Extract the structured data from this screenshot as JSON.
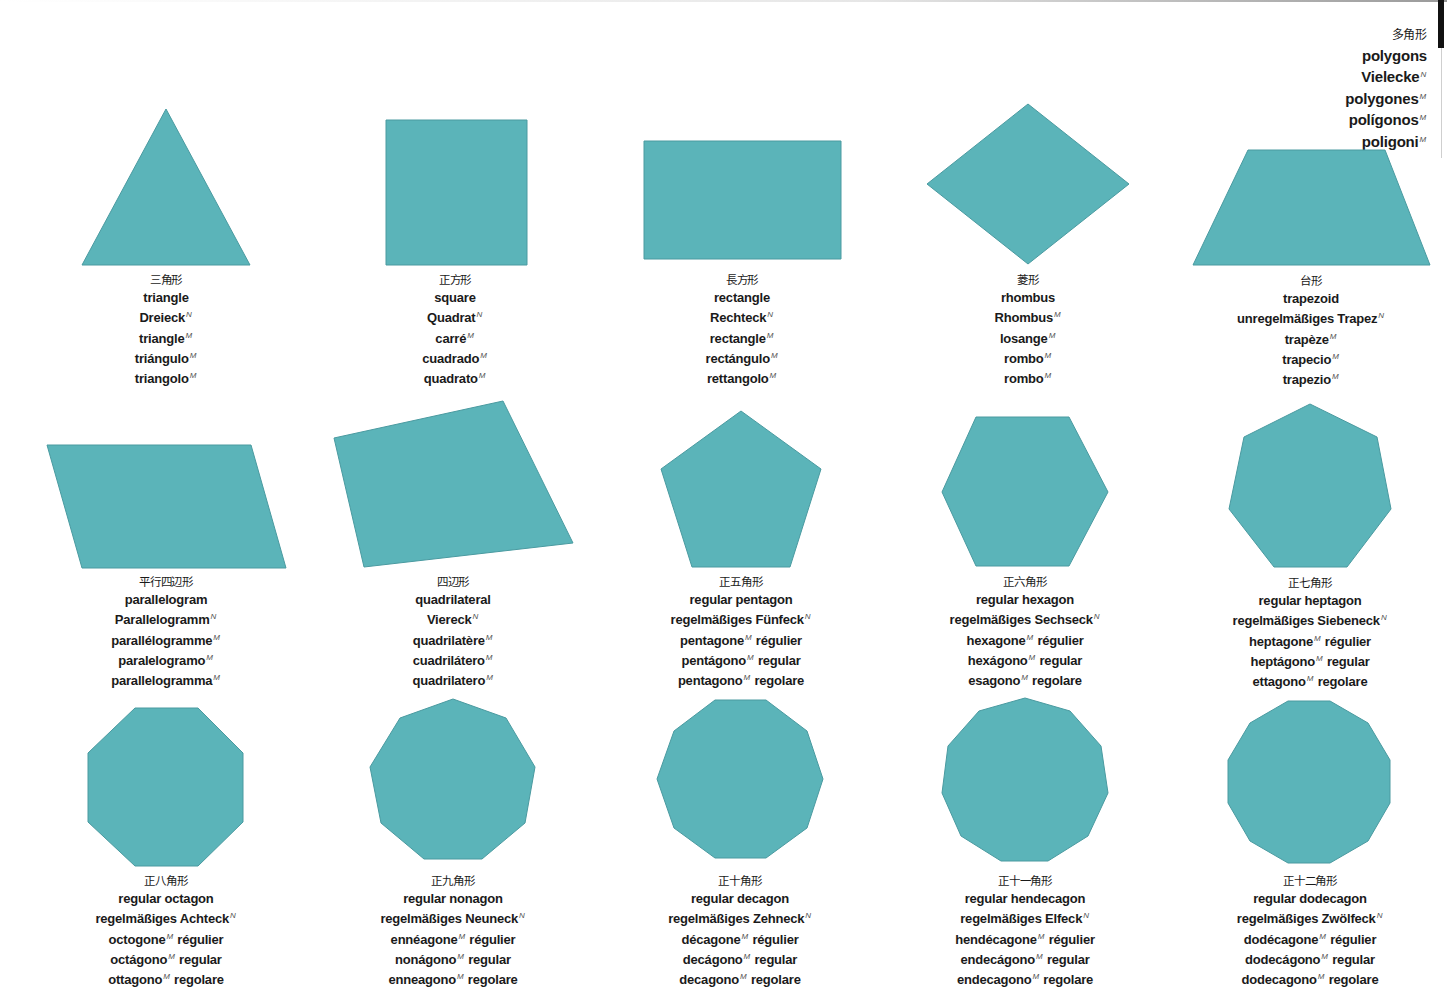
{
  "colors": {
    "shape_fill": "#5bb4b9",
    "shape_stroke": "#4a9aa0",
    "text": "#1a1a1a",
    "superscript": "#555555"
  },
  "header": {
    "lines": [
      {
        "text": "多角形",
        "sup": ""
      },
      {
        "text": "polygons",
        "sup": ""
      },
      {
        "text": "Vielecke",
        "sup": "N"
      },
      {
        "text": "polygones",
        "sup": "M"
      },
      {
        "text": "polígonos",
        "sup": "M"
      },
      {
        "text": "poligoni",
        "sup": "M"
      }
    ]
  },
  "shapes": [
    {
      "id": "triangle",
      "points": "166,109 250,265 82,265",
      "caption_x": 166,
      "caption_y": 272,
      "lines": [
        {
          "text": "三角形",
          "sup": ""
        },
        {
          "text": "triangle",
          "sup": ""
        },
        {
          "text": "Dreieck",
          "sup": "N"
        },
        {
          "text": "triangle",
          "sup": "M"
        },
        {
          "text": "triángulo",
          "sup": "M"
        },
        {
          "text": "triangolo",
          "sup": "M"
        }
      ]
    },
    {
      "id": "square",
      "points": "386,120 527,120 527,265 386,265",
      "caption_x": 455,
      "caption_y": 272,
      "lines": [
        {
          "text": "正方形",
          "sup": ""
        },
        {
          "text": "square",
          "sup": ""
        },
        {
          "text": "Quadrat",
          "sup": "N"
        },
        {
          "text": "carré",
          "sup": "M"
        },
        {
          "text": "cuadrado",
          "sup": "M"
        },
        {
          "text": "quadrato",
          "sup": "M"
        }
      ]
    },
    {
      "id": "rectangle",
      "points": "644,141 841,141 841,259 644,259",
      "caption_x": 742,
      "caption_y": 272,
      "lines": [
        {
          "text": "長方形",
          "sup": ""
        },
        {
          "text": "rectangle",
          "sup": ""
        },
        {
          "text": "Rechteck",
          "sup": "N"
        },
        {
          "text": "rectangle",
          "sup": "M"
        },
        {
          "text": "rectángulo",
          "sup": "M"
        },
        {
          "text": "rettangolo",
          "sup": "M"
        }
      ]
    },
    {
      "id": "rhombus",
      "points": "1028,104 1129,184 1028,264 927,184",
      "caption_x": 1028,
      "caption_y": 272,
      "lines": [
        {
          "text": "菱形",
          "sup": ""
        },
        {
          "text": "rhombus",
          "sup": ""
        },
        {
          "text": "Rhombus",
          "sup": "M"
        },
        {
          "text": "losange",
          "sup": "M"
        },
        {
          "text": "rombo",
          "sup": "M"
        },
        {
          "text": "rombo",
          "sup": "M"
        }
      ]
    },
    {
      "id": "trapezoid",
      "points": "1248,150 1385,150 1430,265 1193,265",
      "caption_x": 1311,
      "caption_y": 273,
      "lines": [
        {
          "text": "台形",
          "sup": ""
        },
        {
          "text": "trapezoid",
          "sup": ""
        },
        {
          "text": "unregelmäßiges Trapez",
          "sup": "N"
        },
        {
          "text": "trapèze",
          "sup": "M"
        },
        {
          "text": "trapecio",
          "sup": "M"
        },
        {
          "text": "trapezio",
          "sup": "M"
        }
      ]
    },
    {
      "id": "parallelogram",
      "points": "47,445 251,445 286,568 82,568",
      "caption_x": 166,
      "caption_y": 574,
      "lines": [
        {
          "text": "平行四辺形",
          "sup": ""
        },
        {
          "text": "parallelogram",
          "sup": ""
        },
        {
          "text": "Parallelogramm",
          "sup": "N"
        },
        {
          "text": "parallélogramme",
          "sup": "M"
        },
        {
          "text": "paralelogramo",
          "sup": "M"
        },
        {
          "text": "parallelogramma",
          "sup": "M"
        }
      ]
    },
    {
      "id": "quadrilateral",
      "points": "334,438 503,401 573,543 364,567",
      "caption_x": 453,
      "caption_y": 574,
      "lines": [
        {
          "text": "四辺形",
          "sup": ""
        },
        {
          "text": "quadrilateral",
          "sup": ""
        },
        {
          "text": "Viereck",
          "sup": "N"
        },
        {
          "text": "quadrilatère",
          "sup": "M"
        },
        {
          "text": "cuadrilátero",
          "sup": "M"
        },
        {
          "text": "quadrilatero",
          "sup": "M"
        }
      ]
    },
    {
      "id": "regular-pentagon",
      "points": "741,411 821,469 790,567 692,567 661,469",
      "caption_x": 741,
      "caption_y": 574,
      "lines": [
        {
          "text": "正五角形",
          "sup": ""
        },
        {
          "text": "regular pentagon",
          "sup": ""
        },
        {
          "text": "regelmäßiges Fünfeck",
          "sup": "N"
        },
        {
          "text": "pentagone",
          "sup": "M",
          "suffix": " régulier"
        },
        {
          "text": "pentágono",
          "sup": "M",
          "suffix": " regular"
        },
        {
          "text": "pentagono",
          "sup": "M",
          "suffix": " regolare"
        }
      ]
    },
    {
      "id": "regular-hexagon",
      "points": "976,417 1069,417 1108,492 1069,566 976,566 942,492",
      "caption_x": 1025,
      "caption_y": 574,
      "lines": [
        {
          "text": "正六角形",
          "sup": ""
        },
        {
          "text": "regular hexagon",
          "sup": ""
        },
        {
          "text": "regelmäßiges Sechseck",
          "sup": "N"
        },
        {
          "text": "hexagone",
          "sup": "M",
          "suffix": " régulier"
        },
        {
          "text": "hexágono",
          "sup": "M",
          "suffix": " regular"
        },
        {
          "text": "esagono",
          "sup": "M",
          "suffix": " regolare"
        }
      ]
    },
    {
      "id": "regular-heptagon",
      "points": "1310,404 1377,437 1391,509 1347,567 1274,567 1229,509 1244,437",
      "caption_x": 1310,
      "caption_y": 575,
      "lines": [
        {
          "text": "正七角形",
          "sup": ""
        },
        {
          "text": "regular heptagon",
          "sup": ""
        },
        {
          "text": "regelmäßiges Siebeneck",
          "sup": "N"
        },
        {
          "text": "heptagone",
          "sup": "M",
          "suffix": " régulier"
        },
        {
          "text": "heptágono",
          "sup": "M",
          "suffix": " regular"
        },
        {
          "text": "ettagono",
          "sup": "M",
          "suffix": " regolare"
        }
      ]
    },
    {
      "id": "regular-octagon",
      "points": "135,708 198,708 243,753 243,822 198,866 135,866 88,822 88,753",
      "caption_x": 166,
      "caption_y": 873,
      "lines": [
        {
          "text": "正八角形",
          "sup": ""
        },
        {
          "text": "regular octagon",
          "sup": ""
        },
        {
          "text": "regelmäßiges Achteck",
          "sup": "N"
        },
        {
          "text": "octogone",
          "sup": "M",
          "suffix": " régulier"
        },
        {
          "text": "octágono",
          "sup": "M",
          "suffix": " regular"
        },
        {
          "text": "ottagono",
          "sup": "M",
          "suffix": " regolare"
        }
      ]
    },
    {
      "id": "regular-nonagon",
      "points": "453,699 506,718 535,767 525,823 482,859 424,859 381,823 370,767 400,718",
      "caption_x": 453,
      "caption_y": 873,
      "lines": [
        {
          "text": "正九角形",
          "sup": ""
        },
        {
          "text": "regular nonagon",
          "sup": ""
        },
        {
          "text": "regelmäßiges Neuneck",
          "sup": "N"
        },
        {
          "text": "ennéagone",
          "sup": "M",
          "suffix": " régulier"
        },
        {
          "text": "nonágono",
          "sup": "M",
          "suffix": " regular"
        },
        {
          "text": "enneagono",
          "sup": "M",
          "suffix": " regolare"
        }
      ]
    },
    {
      "id": "regular-decagon",
      "points": "715,700 766,700 807,731 823,779 807,828 766,858 715,858 674,828 657,779 674,731",
      "caption_x": 740,
      "caption_y": 873,
      "lines": [
        {
          "text": "正十角形",
          "sup": ""
        },
        {
          "text": "regular decagon",
          "sup": ""
        },
        {
          "text": "regelmäßiges Zehneck",
          "sup": "N"
        },
        {
          "text": "décagone",
          "sup": "M",
          "suffix": " régulier"
        },
        {
          "text": "decágono",
          "sup": "M",
          "suffix": " regular"
        },
        {
          "text": "decagono",
          "sup": "M",
          "suffix": " regolare"
        }
      ]
    },
    {
      "id": "regular-hendecagon",
      "points": "1025,698 1070,711 1101,746 1108,793 1088,836 1048,861 1001,861 961,836 942,793 948,746 979,711",
      "caption_x": 1025,
      "caption_y": 873,
      "lines": [
        {
          "text": "正十一角形",
          "sup": ""
        },
        {
          "text": "regular hendecagon",
          "sup": ""
        },
        {
          "text": "regelmäßiges Elfeck",
          "sup": "N"
        },
        {
          "text": "hendécagone",
          "sup": "M",
          "suffix": " régulier"
        },
        {
          "text": "endecágono",
          "sup": "M",
          "suffix": " regular"
        },
        {
          "text": "endecagono",
          "sup": "M",
          "suffix": " regolare"
        }
      ]
    },
    {
      "id": "regular-dodecagon",
      "points": "1288,701 1330,701 1368,723 1390,760 1390,803 1368,841 1330,863 1288,863 1250,841 1228,803 1228,760 1250,723",
      "caption_x": 1310,
      "caption_y": 873,
      "lines": [
        {
          "text": "正十二角形",
          "sup": ""
        },
        {
          "text": "regular dodecagon",
          "sup": ""
        },
        {
          "text": "regelmäßiges Zwölfeck",
          "sup": "N"
        },
        {
          "text": "dodécagone",
          "sup": "M",
          "suffix": " régulier"
        },
        {
          "text": "dodecágono",
          "sup": "M",
          "suffix": " regular"
        },
        {
          "text": "dodecagono",
          "sup": "M",
          "suffix": " regolare"
        }
      ]
    }
  ]
}
